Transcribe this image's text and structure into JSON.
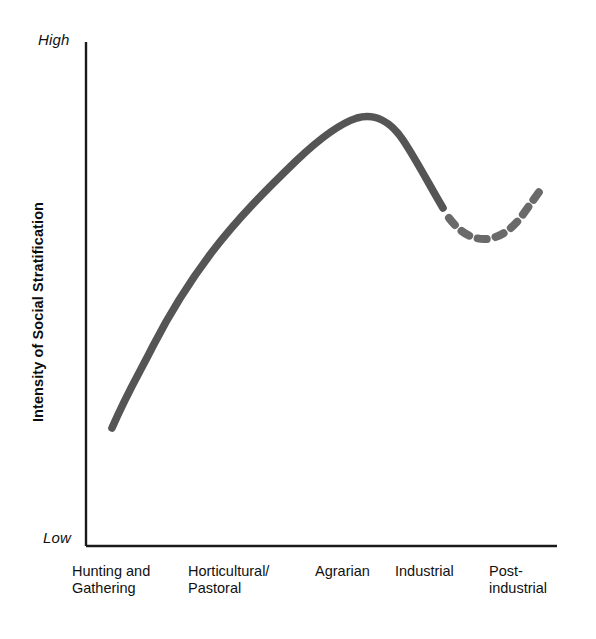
{
  "chart_data": {
    "type": "line",
    "title": "",
    "xlabel": "",
    "ylabel": "Intensity of Social Stratification",
    "y_axis": {
      "high_label": "High",
      "low_label": "Low",
      "ticks": [],
      "grid": false
    },
    "x_axis": {
      "grid": false
    },
    "categories": [
      "Hunting and\nGathering",
      "Horticultural/\nPastoral",
      "Agrarian",
      "Industrial",
      "Post-\nindustrial"
    ],
    "series": [
      {
        "name": "Intensity of social stratification",
        "style": "solid",
        "color": "#555555",
        "points": [
          {
            "x": 112,
            "y": 428
          },
          {
            "x": 150,
            "y": 350
          },
          {
            "x": 200,
            "y": 272
          },
          {
            "x": 260,
            "y": 196
          },
          {
            "x": 310,
            "y": 148
          },
          {
            "x": 357,
            "y": 118
          },
          {
            "x": 400,
            "y": 134
          },
          {
            "x": 428,
            "y": 172
          },
          {
            "x": 443,
            "y": 208
          }
        ]
      },
      {
        "name": "Projected trend",
        "style": "dashed",
        "color": "#6a6a6a",
        "points": [
          {
            "x": 446,
            "y": 214
          },
          {
            "x": 462,
            "y": 230
          },
          {
            "x": 478,
            "y": 238
          },
          {
            "x": 492,
            "y": 238
          },
          {
            "x": 508,
            "y": 230
          },
          {
            "x": 524,
            "y": 212
          },
          {
            "x": 540,
            "y": 190
          }
        ]
      }
    ],
    "legend": {
      "entries": [],
      "position": "none"
    }
  },
  "axes": {
    "line_color": "#1a1a1a",
    "origin": {
      "x": 86,
      "y": 546
    },
    "top": {
      "x": 86,
      "y": 42
    },
    "right": {
      "x": 557,
      "y": 546
    }
  }
}
